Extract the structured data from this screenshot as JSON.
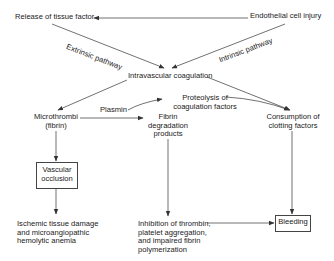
{
  "diagram": {
    "nodes": {
      "release_tissue_factor": "Release of tissue factor",
      "endothelial_injury": "Endothelial cell injury",
      "intravascular_coagulation": "Intravascular coagulation",
      "microthrombi": [
        "Microthrombi",
        "(fibrin)"
      ],
      "plasmin": "Plasmin",
      "proteolysis": [
        "Proteolysis of",
        "coagulation factors"
      ],
      "fibrin_degradation": [
        "Fibrin",
        "degradation",
        "products"
      ],
      "consumption": [
        "Consumption of",
        "clotting factors"
      ],
      "vascular_occlusion": [
        "Vascular",
        "occlusion"
      ],
      "ischemic_damage": [
        "Ischemic tissue damage",
        "and microangiopathic",
        "hemolytic anemia"
      ],
      "inhibition": [
        "Inhibition of thrombin,",
        "platelet aggregation,",
        "and impaired fibrin",
        "polymerization"
      ],
      "bleeding": "Bleeding"
    },
    "edge_labels": {
      "extrinsic": "Extrinsic pathway",
      "intrinsic": "Intrinsic pathway"
    },
    "edges": [
      {
        "from": "endothelial_injury",
        "to": "release_tissue_factor"
      },
      {
        "from": "release_tissue_factor",
        "to": "intravascular_coagulation",
        "label": "extrinsic"
      },
      {
        "from": "endothelial_injury",
        "to": "intravascular_coagulation",
        "label": "intrinsic"
      },
      {
        "from": "intravascular_coagulation",
        "to": "microthrombi"
      },
      {
        "from": "intravascular_coagulation",
        "to": "consumption"
      },
      {
        "from": "microthrombi",
        "to": "fibrin_degradation"
      },
      {
        "from": "plasmin",
        "to": "proteolysis"
      },
      {
        "from": "proteolysis",
        "to": "consumption"
      },
      {
        "from": "microthrombi",
        "to": "vascular_occlusion"
      },
      {
        "from": "vascular_occlusion",
        "to": "ischemic_damage"
      },
      {
        "from": "fibrin_degradation",
        "to": "inhibition"
      },
      {
        "from": "inhibition",
        "to": "bleeding"
      },
      {
        "from": "consumption",
        "to": "bleeding"
      }
    ],
    "colors": {
      "line": "#333333",
      "text": "#222222",
      "background": "#ffffff"
    }
  }
}
